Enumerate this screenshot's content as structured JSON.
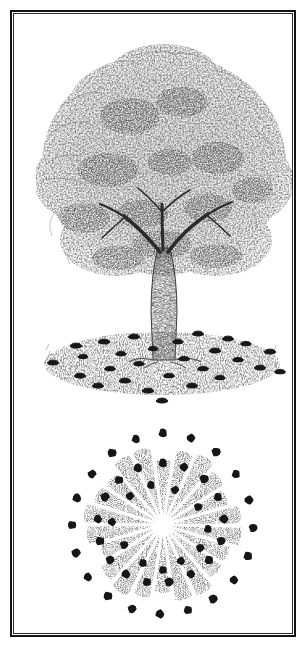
{
  "figure": {
    "medium": "pen-and-ink stipple illustration",
    "background_color": "#ffffff",
    "ink_color": "#1a1a1a",
    "frame": {
      "border_color": "#141414",
      "border_width_px": 2,
      "x": 10,
      "y": 10,
      "width": 286,
      "height": 627
    }
  },
  "panels": [
    {
      "id": "elevation",
      "name": "tree-elevation-view",
      "caption": "",
      "description": "Side view of a broad deciduous tree with a stippled crown, single trunk and a grassy mound at its base ringed with dark mushroom caps.",
      "crown": {
        "center_x": 152,
        "center_y": 150,
        "radius_x": 124,
        "radius_y": 112,
        "top_y": 38,
        "left_x": 28,
        "right_x": 278,
        "tone": "#4a4a4a"
      },
      "trunk": {
        "base_x": 152,
        "base_y": 348,
        "top_y": 232,
        "base_half_width": 11,
        "top_half_width": 5,
        "tone": "#2b2b2b"
      },
      "ground": {
        "center_x": 150,
        "center_y": 352,
        "radius_x": 118,
        "radius_y": 30,
        "tone": "#6e6e6e"
      }
    },
    {
      "id": "plan",
      "name": "tree-plan-view",
      "caption": "",
      "description": "Top-down plan of the same tree: a radial stippled canopy rosette encircled by two concentric rings of mushroom dots marking the fairy ring at and beyond the drip line.",
      "canopy": {
        "center_x": 151,
        "center_y": 113,
        "radius": 78,
        "ray_count": 22,
        "tone": "#555555"
      }
    }
  ],
  "chart_data": {
    "type": "scatter",
    "xlabel": "",
    "ylabel": "",
    "series": [
      {
        "name": "elevation-view-mushrooms",
        "panel": "elevation",
        "marker": "ellipse",
        "marker_color": "#181818",
        "points": [
          {
            "x": 41,
            "y": 351,
            "rx": 6.0,
            "ry": 2.4
          },
          {
            "x": 64,
            "y": 334,
            "rx": 6.2,
            "ry": 2.5
          },
          {
            "x": 68,
            "y": 364,
            "rx": 6.0,
            "ry": 2.4
          },
          {
            "x": 71,
            "y": 345,
            "rx": 5.6,
            "ry": 2.2
          },
          {
            "x": 86,
            "y": 374,
            "rx": 6.0,
            "ry": 2.4
          },
          {
            "x": 92,
            "y": 330,
            "rx": 6.2,
            "ry": 2.5
          },
          {
            "x": 98,
            "y": 357,
            "rx": 5.8,
            "ry": 2.3
          },
          {
            "x": 109,
            "y": 342,
            "rx": 5.6,
            "ry": 2.3
          },
          {
            "x": 113,
            "y": 369,
            "rx": 6.2,
            "ry": 2.5
          },
          {
            "x": 122,
            "y": 325,
            "rx": 6.0,
            "ry": 2.4
          },
          {
            "x": 127,
            "y": 352,
            "rx": 5.8,
            "ry": 2.3
          },
          {
            "x": 136,
            "y": 379,
            "rx": 6.2,
            "ry": 2.5
          },
          {
            "x": 141,
            "y": 337,
            "rx": 5.4,
            "ry": 2.2
          },
          {
            "x": 150,
            "y": 389,
            "rx": 6.2,
            "ry": 2.5
          },
          {
            "x": 157,
            "y": 364,
            "rx": 5.8,
            "ry": 2.3
          },
          {
            "x": 166,
            "y": 330,
            "rx": 5.6,
            "ry": 2.3
          },
          {
            "x": 172,
            "y": 347,
            "rx": 5.8,
            "ry": 2.3
          },
          {
            "x": 180,
            "y": 374,
            "rx": 6.0,
            "ry": 2.4
          },
          {
            "x": 186,
            "y": 322,
            "rx": 6.0,
            "ry": 2.4
          },
          {
            "x": 191,
            "y": 357,
            "rx": 5.8,
            "ry": 2.3
          },
          {
            "x": 203,
            "y": 339,
            "rx": 6.2,
            "ry": 2.5
          },
          {
            "x": 208,
            "y": 366,
            "rx": 5.6,
            "ry": 2.3
          },
          {
            "x": 216,
            "y": 327,
            "rx": 6.0,
            "ry": 2.4
          },
          {
            "x": 226,
            "y": 348,
            "rx": 5.8,
            "ry": 2.3
          },
          {
            "x": 234,
            "y": 332,
            "rx": 5.6,
            "ry": 2.3
          },
          {
            "x": 248,
            "y": 356,
            "rx": 6.0,
            "ry": 2.4
          },
          {
            "x": 258,
            "y": 340,
            "rx": 6.2,
            "ry": 2.5
          },
          {
            "x": 268,
            "y": 360,
            "rx": 5.8,
            "ry": 2.3
          }
        ]
      },
      {
        "name": "plan-view-mushrooms-inner-ring",
        "panel": "plan",
        "marker": "dot",
        "marker_color": "#161616",
        "ring_radius": 62,
        "count": 18,
        "points": [
          {
            "x": 151,
            "y": 51,
            "r": 4.4
          },
          {
            "x": 172,
            "y": 55,
            "r": 4.2
          },
          {
            "x": 192,
            "y": 67,
            "r": 4.4
          },
          {
            "x": 206,
            "y": 85,
            "r": 4.2
          },
          {
            "x": 212,
            "y": 107,
            "r": 4.4
          },
          {
            "x": 209,
            "y": 129,
            "r": 4.2
          },
          {
            "x": 197,
            "y": 148,
            "r": 4.4
          },
          {
            "x": 179,
            "y": 162,
            "r": 4.2
          },
          {
            "x": 157,
            "y": 170,
            "r": 4.4
          },
          {
            "x": 135,
            "y": 170,
            "r": 4.2
          },
          {
            "x": 114,
            "y": 162,
            "r": 4.4
          },
          {
            "x": 98,
            "y": 148,
            "r": 4.2
          },
          {
            "x": 88,
            "y": 129,
            "r": 4.4
          },
          {
            "x": 86,
            "y": 107,
            "r": 4.2
          },
          {
            "x": 93,
            "y": 85,
            "r": 4.4
          },
          {
            "x": 107,
            "y": 68,
            "r": 4.2
          },
          {
            "x": 126,
            "y": 56,
            "r": 4.4
          },
          {
            "x": 163,
            "y": 78,
            "r": 4.0
          }
        ]
      },
      {
        "name": "plan-view-mushrooms-outer-ring",
        "panel": "plan",
        "marker": "dot",
        "marker_color": "#161616",
        "ring_radius": 92,
        "count": 20,
        "points": [
          {
            "x": 151,
            "y": 21,
            "r": 4.4
          },
          {
            "x": 179,
            "y": 26,
            "r": 4.2
          },
          {
            "x": 204,
            "y": 40,
            "r": 4.4
          },
          {
            "x": 224,
            "y": 62,
            "r": 4.2
          },
          {
            "x": 237,
            "y": 88,
            "r": 4.4
          },
          {
            "x": 241,
            "y": 116,
            "r": 4.2
          },
          {
            "x": 236,
            "y": 144,
            "r": 4.4
          },
          {
            "x": 222,
            "y": 168,
            "r": 4.2
          },
          {
            "x": 201,
            "y": 187,
            "r": 4.4
          },
          {
            "x": 176,
            "y": 198,
            "r": 4.2
          },
          {
            "x": 148,
            "y": 202,
            "r": 4.4
          },
          {
            "x": 120,
            "y": 197,
            "r": 4.2
          },
          {
            "x": 96,
            "y": 184,
            "r": 4.4
          },
          {
            "x": 76,
            "y": 165,
            "r": 4.2
          },
          {
            "x": 64,
            "y": 141,
            "r": 4.4
          },
          {
            "x": 60,
            "y": 113,
            "r": 4.2
          },
          {
            "x": 65,
            "y": 86,
            "r": 4.4
          },
          {
            "x": 80,
            "y": 62,
            "r": 4.2
          },
          {
            "x": 100,
            "y": 41,
            "r": 4.4
          },
          {
            "x": 124,
            "y": 27,
            "r": 4.2
          }
        ]
      },
      {
        "name": "plan-view-mushrooms-scattered",
        "panel": "plan",
        "marker": "dot",
        "marker_color": "#161616",
        "points": [
          {
            "x": 139,
            "y": 73,
            "r": 4.0
          },
          {
            "x": 118,
            "y": 84,
            "r": 4.0
          },
          {
            "x": 186,
            "y": 95,
            "r": 4.0
          },
          {
            "x": 196,
            "y": 117,
            "r": 4.0
          },
          {
            "x": 100,
            "y": 110,
            "r": 4.0
          },
          {
            "x": 112,
            "y": 133,
            "r": 4.0
          },
          {
            "x": 131,
            "y": 151,
            "r": 4.0
          },
          {
            "x": 169,
            "y": 149,
            "r": 4.0
          },
          {
            "x": 188,
            "y": 136,
            "r": 4.0
          },
          {
            "x": 151,
            "y": 158,
            "r": 4.0
          }
        ]
      }
    ]
  }
}
